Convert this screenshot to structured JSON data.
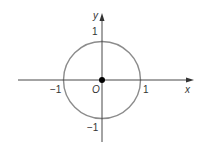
{
  "diagram": {
    "type": "unit-circle",
    "axes": {
      "x_label": "x",
      "y_label": "y",
      "origin_label": "O"
    },
    "ticks": {
      "x_pos": "1",
      "x_neg": "−1",
      "y_pos": "1",
      "y_neg": "−1"
    },
    "colors": {
      "circle": "#8c8c8c",
      "axis": "#333333",
      "point": "#000000"
    }
  }
}
